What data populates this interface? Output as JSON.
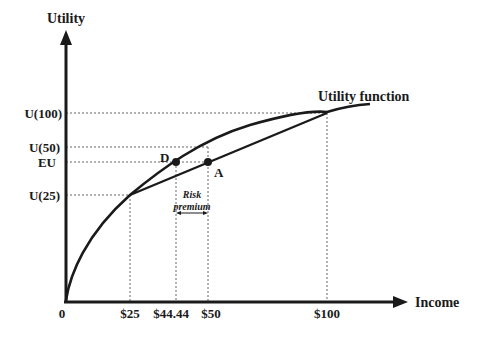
{
  "diagram": {
    "axes": {
      "y_label": "Utility",
      "x_label": "Income",
      "origin_label": "0"
    },
    "y_ticks": [
      {
        "label": "U(100)",
        "y": 113
      },
      {
        "label": "U(50)",
        "y": 147
      },
      {
        "label": "EU",
        "y": 162
      },
      {
        "label": "U(25)",
        "y": 195
      }
    ],
    "x_ticks": [
      {
        "label": "$25",
        "x": 130
      },
      {
        "label": "$44.44",
        "x": 176
      },
      {
        "label": "$50",
        "x": 208
      },
      {
        "label": "$100",
        "x": 327
      }
    ],
    "curve_label": "Utility function",
    "points": [
      {
        "label": "D",
        "x": 176,
        "y": 162
      },
      {
        "label": "A",
        "x": 208,
        "y": 162
      }
    ],
    "annotation": {
      "line1": "Risk",
      "line2": "premium"
    },
    "colors": {
      "ink": "#1a1a1a",
      "dotted": "#555555",
      "background": "#ffffff"
    }
  }
}
